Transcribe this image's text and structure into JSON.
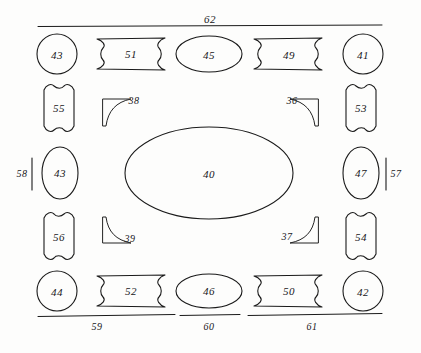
{
  "figure": {
    "type": "patent-mechanical-layout-diagram",
    "background_color": "#fdfdfc",
    "line_color": "#1a1a1a",
    "canvas": {
      "width": 421,
      "height": 353
    }
  },
  "center": {
    "part": {
      "id": "40",
      "label": "40",
      "shape": "ellipse",
      "cx": 209,
      "cy": 173,
      "rx": 84,
      "ry": 46
    }
  },
  "top_row": {
    "parts": [
      {
        "id": "43",
        "label": "43",
        "shape": "circle",
        "cx": 57,
        "cy": 54,
        "r": 20
      },
      {
        "id": "51",
        "label": "51",
        "shape": "bone-horizontal",
        "cx": 131,
        "cy": 54,
        "w": 76,
        "h": 34
      },
      {
        "id": "45",
        "label": "45",
        "shape": "ellipse",
        "cx": 209,
        "cy": 54,
        "rx": 33,
        "ry": 18
      },
      {
        "id": "49",
        "label": "49",
        "shape": "bone-horizontal",
        "cx": 288,
        "cy": 54,
        "w": 76,
        "h": 34
      },
      {
        "id": "41",
        "label": "41",
        "shape": "circle",
        "cx": 363,
        "cy": 54,
        "r": 20
      }
    ]
  },
  "upper_side_row": {
    "parts": [
      {
        "id": "55",
        "label": "55",
        "shape": "bone-vertical",
        "cx": 59,
        "cy": 108,
        "w": 32,
        "h": 44
      },
      {
        "id": "53",
        "label": "53",
        "shape": "bone-vertical",
        "cx": 361,
        "cy": 108,
        "w": 32,
        "h": 44
      }
    ]
  },
  "middle_side_row": {
    "parts": [
      {
        "id": "43",
        "label": "43",
        "shape": "ellipse",
        "cx": 60,
        "cy": 173,
        "rx": 18,
        "ry": 26
      },
      {
        "id": "47",
        "label": "47",
        "shape": "ellipse",
        "cx": 361,
        "cy": 173,
        "rx": 18,
        "ry": 26
      }
    ]
  },
  "lower_side_row": {
    "parts": [
      {
        "id": "56",
        "label": "56",
        "shape": "bone-vertical",
        "cx": 59,
        "cy": 236,
        "w": 32,
        "h": 44
      },
      {
        "id": "54",
        "label": "54",
        "shape": "bone-vertical",
        "cx": 361,
        "cy": 236,
        "w": 32,
        "h": 44
      }
    ]
  },
  "bottom_row": {
    "parts": [
      {
        "id": "44",
        "label": "44",
        "shape": "circle",
        "cx": 57,
        "cy": 291,
        "r": 20
      },
      {
        "id": "52",
        "label": "52",
        "shape": "bone-horizontal",
        "cx": 131,
        "cy": 291,
        "w": 76,
        "h": 34
      },
      {
        "id": "46",
        "label": "46",
        "shape": "ellipse",
        "cx": 209,
        "cy": 291,
        "rx": 33,
        "ry": 17
      },
      {
        "id": "50",
        "label": "50",
        "shape": "bone-horizontal",
        "cx": 288,
        "cy": 291,
        "w": 76,
        "h": 34
      },
      {
        "id": "42",
        "label": "42",
        "shape": "circle",
        "cx": 363,
        "cy": 291,
        "r": 20
      }
    ]
  },
  "corner_brackets": [
    {
      "id": "38",
      "label": "38",
      "corner": "top-left",
      "label_x": 134,
      "label_y": 100
    },
    {
      "id": "36",
      "label": "36",
      "corner": "top-right",
      "label_x": 292,
      "label_y": 100
    },
    {
      "id": "39",
      "label": "39",
      "corner": "bottom-left",
      "label_x": 130,
      "label_y": 238
    },
    {
      "id": "37",
      "label": "37",
      "corner": "bottom-right",
      "label_x": 287,
      "label_y": 236
    }
  ],
  "dimensions": {
    "top": {
      "id": "62",
      "label": "62",
      "label_x": 210,
      "label_y": 19,
      "x1": 38,
      "x2": 382,
      "y": 26
    },
    "bottom": [
      {
        "id": "59",
        "label": "59",
        "label_x": 97,
        "label_y": 326,
        "x1": 38,
        "x2": 175,
        "y": 315
      },
      {
        "id": "60",
        "label": "60",
        "label_x": 209,
        "label_y": 326,
        "x1": 180,
        "x2": 240,
        "y": 315
      },
      {
        "id": "61",
        "label": "61",
        "label_x": 312,
        "label_y": 326,
        "x1": 248,
        "x2": 382,
        "y": 315
      }
    ],
    "left": {
      "id": "58",
      "label": "58",
      "label_x": 22,
      "label_y": 173,
      "tick_x": 32,
      "y1": 158,
      "y2": 190
    },
    "right": {
      "id": "57",
      "label": "57",
      "label_x": 396,
      "label_y": 173,
      "tick_x": 386,
      "y1": 158,
      "y2": 190
    }
  }
}
